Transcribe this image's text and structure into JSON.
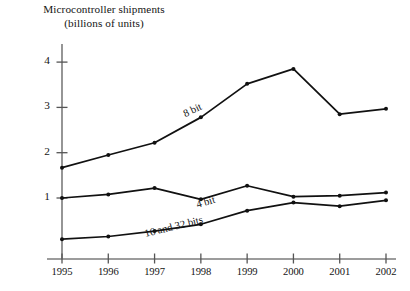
{
  "chart_data": {
    "type": "line",
    "title": "Microcontroller shipments",
    "subtitle": "(billions of units)",
    "title_line1": "Microcontroller shipments",
    "title_line2": "(billions of units)",
    "xlabel": "",
    "ylabel": "",
    "categories": [
      "1995",
      "1996",
      "1997",
      "1998",
      "1999",
      "2000",
      "2001",
      "2002"
    ],
    "x": [
      1995,
      1996,
      1997,
      1998,
      1999,
      2000,
      2001,
      2002
    ],
    "xlim": [
      1995,
      2002
    ],
    "ylim": [
      0,
      4.35
    ],
    "yticks": [
      1,
      2,
      3,
      4
    ],
    "ytick_labels": [
      "1",
      "2",
      "3",
      "4"
    ],
    "grid": false,
    "legend": "inline-annotations",
    "line_color": "#111111",
    "marker": "circle",
    "series": [
      {
        "name": "8 bit",
        "label": "8 bit",
        "values": [
          1.67,
          1.95,
          2.22,
          2.78,
          3.52,
          3.85,
          2.85,
          2.97
        ]
      },
      {
        "name": "4 bit",
        "label": "4 bit",
        "values": [
          1.0,
          1.08,
          1.22,
          0.97,
          1.27,
          1.03,
          1.05,
          1.12
        ]
      },
      {
        "name": "16 and 32 bits",
        "label": "16 and 32 bits",
        "values": [
          0.09,
          0.15,
          0.27,
          0.42,
          0.72,
          0.9,
          0.82,
          0.95
        ]
      }
    ],
    "annotations": [
      {
        "text": "8 bit",
        "x": 186,
        "y": 108,
        "rotation": -25
      },
      {
        "text": "4 bit",
        "x": 198,
        "y": 199,
        "rotation": -17
      },
      {
        "text": "16 and 32 bits",
        "x": 146,
        "y": 228,
        "rotation": -14
      }
    ]
  }
}
